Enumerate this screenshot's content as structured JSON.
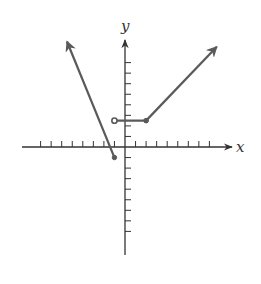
{
  "chart_data": {
    "type": "line",
    "title": "",
    "xlabel": "x",
    "ylabel": "y",
    "xlim": [
      -8,
      8
    ],
    "ylim": [
      -8,
      8
    ],
    "grid": false,
    "x_ticks_per_side": 8,
    "y_ticks_per_side": 8,
    "tick_labels": "none",
    "series": [
      {
        "name": "left-ray",
        "kind": "ray",
        "points": [
          [
            -1,
            -1
          ],
          [
            -5.5,
            10
          ]
        ],
        "start_marker": "closed",
        "end_marker": "arrow"
      },
      {
        "name": "middle-segment",
        "kind": "segment",
        "points": [
          [
            -1,
            2.5
          ],
          [
            2,
            2.5
          ]
        ],
        "start_marker": "open",
        "end_marker": "closed"
      },
      {
        "name": "right-ray",
        "kind": "ray",
        "points": [
          [
            2,
            2.5
          ],
          [
            8.7,
            9.5
          ]
        ],
        "start_marker": "closed",
        "end_marker": "arrow"
      }
    ],
    "annotations": []
  },
  "labels": {
    "x_axis": "x",
    "y_axis": "y"
  },
  "colors": {
    "axis": "#333333",
    "curve": "#5a5a5a"
  }
}
